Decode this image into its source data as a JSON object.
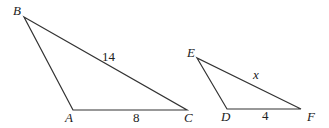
{
  "diagram": {
    "triangles": [
      {
        "name": "ABC",
        "vertices": {
          "A": {
            "x": 73,
            "y": 110,
            "label": "A",
            "lx": 65,
            "ly": 122
          },
          "B": {
            "x": 24,
            "y": 17,
            "label": "B",
            "lx": 13,
            "ly": 15
          },
          "C": {
            "x": 187,
            "y": 110,
            "label": "C",
            "lx": 184,
            "ly": 122
          }
        },
        "side_labels": [
          {
            "side": "BC",
            "text": "14",
            "x": 102,
            "y": 61
          },
          {
            "side": "AC",
            "text": "8",
            "x": 133,
            "y": 122
          }
        ]
      },
      {
        "name": "EDF",
        "vertices": {
          "E": {
            "x": 197,
            "y": 58,
            "label": "E",
            "lx": 187,
            "ly": 57
          },
          "D": {
            "x": 227,
            "y": 109,
            "label": "D",
            "lx": 221,
            "ly": 121
          },
          "F": {
            "x": 301,
            "y": 109,
            "label": "F",
            "lx": 307,
            "ly": 121
          }
        },
        "side_labels": [
          {
            "side": "EF",
            "text": "x",
            "x": 253,
            "y": 79,
            "italic": true
          },
          {
            "side": "DF",
            "text": "4",
            "x": 262,
            "y": 120
          }
        ]
      }
    ]
  }
}
